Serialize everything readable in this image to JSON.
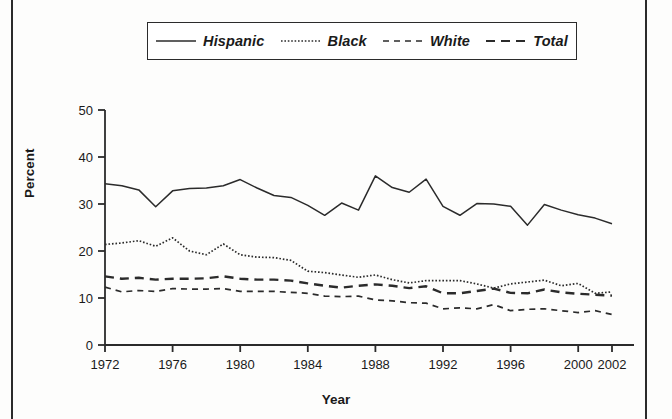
{
  "figure": {
    "y_axis_title": "Percent",
    "x_axis_title": "Year"
  },
  "legend": {
    "entries": [
      {
        "label": "Hispanic",
        "style": "solid",
        "icon": "solid-line-swatch-icon"
      },
      {
        "label": "Black",
        "style": "dotted",
        "icon": "dotted-line-swatch-icon"
      },
      {
        "label": "White",
        "style": "dashed",
        "icon": "dashed-line-swatch-icon"
      },
      {
        "label": "Total",
        "style": "longdashed",
        "icon": "long-dashed-line-swatch-icon"
      }
    ]
  },
  "chart_data": {
    "type": "line",
    "title": "",
    "xlabel": "Year",
    "ylabel": "Percent",
    "xlim": [
      1972,
      2002
    ],
    "ylim": [
      0,
      50
    ],
    "yticks": [
      0,
      10,
      20,
      30,
      40,
      50
    ],
    "xticks": [
      1972,
      1976,
      1980,
      1984,
      1988,
      1992,
      1996,
      2000,
      2002
    ],
    "grid": false,
    "legend_position": "top-center",
    "x": [
      1972,
      1973,
      1974,
      1975,
      1976,
      1977,
      1978,
      1979,
      1980,
      1981,
      1982,
      1983,
      1984,
      1985,
      1986,
      1987,
      1988,
      1989,
      1990,
      1991,
      1992,
      1993,
      1994,
      1995,
      1996,
      1997,
      1998,
      1999,
      2000,
      2001,
      2002
    ],
    "series": [
      {
        "name": "Hispanic",
        "style": "solid",
        "values": [
          34.3,
          33.9,
          33.0,
          29.4,
          32.8,
          33.3,
          33.4,
          33.9,
          35.2,
          33.4,
          31.8,
          31.4,
          29.7,
          27.6,
          30.2,
          28.7,
          36.0,
          33.5,
          32.5,
          35.3,
          29.5,
          27.6,
          30.1,
          30.0,
          29.5,
          25.5,
          29.9,
          28.7,
          27.7,
          27.0,
          25.8
        ]
      },
      {
        "name": "Black",
        "style": "dotted",
        "values": [
          21.4,
          21.7,
          22.2,
          21.0,
          22.8,
          20.0,
          19.2,
          21.5,
          19.2,
          18.7,
          18.6,
          18.0,
          15.7,
          15.4,
          14.9,
          14.4,
          14.9,
          13.9,
          13.2,
          13.7,
          13.7,
          13.7,
          13.0,
          12.1,
          13.0,
          13.4,
          13.8,
          12.6,
          13.1,
          11.0,
          11.3
        ]
      },
      {
        "name": "White",
        "style": "dashed",
        "values": [
          12.3,
          11.3,
          11.6,
          11.4,
          12.0,
          11.9,
          11.9,
          12.0,
          11.4,
          11.4,
          11.4,
          11.2,
          11.0,
          10.4,
          10.3,
          10.4,
          9.6,
          9.4,
          9.0,
          8.9,
          7.7,
          7.9,
          7.7,
          8.6,
          7.3,
          7.6,
          7.7,
          7.3,
          6.9,
          7.3,
          6.5
        ]
      },
      {
        "name": "Total",
        "style": "longdashed",
        "values": [
          14.6,
          14.1,
          14.3,
          13.9,
          14.1,
          14.1,
          14.2,
          14.6,
          14.1,
          13.9,
          13.9,
          13.7,
          13.1,
          12.6,
          12.2,
          12.6,
          12.9,
          12.6,
          12.1,
          12.5,
          11.0,
          11.0,
          11.5,
          12.0,
          11.1,
          11.0,
          11.8,
          11.2,
          10.9,
          10.7,
          10.5
        ]
      }
    ]
  }
}
